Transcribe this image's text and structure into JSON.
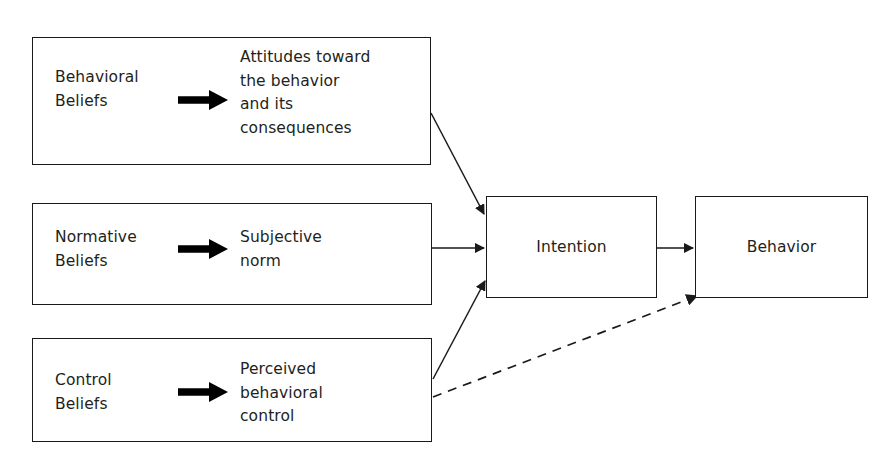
{
  "diagram": {
    "background_color": "#ffffff",
    "stroke_color": "#1a1a1a",
    "text_color": "#231f20"
  },
  "antecedents": [
    {
      "id": "behavioral",
      "belief_label": "Behavioral\nBeliefs",
      "arrow_icon": "bold-right-arrow-icon",
      "construct_label": "Attitudes toward\nthe behavior\nand its\nconsequences"
    },
    {
      "id": "normative",
      "belief_label": "Normative\nBeliefs",
      "arrow_icon": "bold-right-arrow-icon",
      "construct_label": "Subjective\nnorm"
    },
    {
      "id": "control",
      "belief_label": "Control\nBeliefs",
      "arrow_icon": "bold-right-arrow-icon",
      "construct_label": "Perceived\nbehavioral\ncontrol"
    }
  ],
  "outcomes": {
    "intention_label": "Intention",
    "behavior_label": "Behavior"
  },
  "connectors": [
    {
      "id": "attitudes-to-intention",
      "from": "behavioral",
      "to": "intention",
      "style": "solid",
      "arrowhead": true
    },
    {
      "id": "norm-to-intention",
      "from": "normative",
      "to": "intention",
      "style": "solid",
      "arrowhead": true
    },
    {
      "id": "control-to-intention",
      "from": "control",
      "to": "intention",
      "style": "solid",
      "arrowhead": true
    },
    {
      "id": "intention-to-behavior",
      "from": "intention",
      "to": "behavior",
      "style": "solid",
      "arrowhead": true
    },
    {
      "id": "control-to-behavior",
      "from": "control",
      "to": "behavior",
      "style": "dashed",
      "arrowhead": true
    }
  ]
}
